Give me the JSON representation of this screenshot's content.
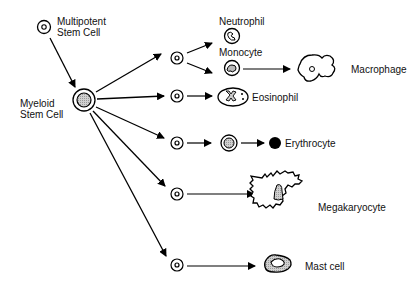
{
  "nodes": {
    "multipotent": {
      "label_line1": "Multipotent",
      "label_line2": "Stem Cell"
    },
    "myeloid": {
      "label_line1": "Myeloid",
      "label_line2": "Stem Cell"
    },
    "neutrophil": {
      "label": "Neutrophil"
    },
    "monocyte": {
      "label": "Monocyte"
    },
    "macrophage": {
      "label": "Macrophage"
    },
    "eosinophil": {
      "label": "Eosinophil"
    },
    "erythrocyte": {
      "label": "Erythrocyte"
    },
    "megakaryocyte": {
      "label": "Megakaryocyte"
    },
    "mast_cell": {
      "label": "Mast cell"
    }
  },
  "edges": [
    [
      "multipotent",
      "myeloid"
    ],
    [
      "myeloid",
      "progenitor-1"
    ],
    [
      "myeloid",
      "progenitor-2"
    ],
    [
      "myeloid",
      "progenitor-3"
    ],
    [
      "myeloid",
      "progenitor-4"
    ],
    [
      "myeloid",
      "progenitor-5"
    ],
    [
      "progenitor-1",
      "neutrophil"
    ],
    [
      "progenitor-1",
      "monocyte"
    ],
    [
      "monocyte",
      "macrophage"
    ],
    [
      "progenitor-2",
      "eosinophil"
    ],
    [
      "progenitor-3",
      "erythroblast"
    ],
    [
      "erythroblast",
      "erythrocyte"
    ],
    [
      "progenitor-4",
      "megakaryocyte"
    ],
    [
      "progenitor-5",
      "mast_cell"
    ]
  ],
  "colors": {
    "stroke": "#000000",
    "fill_gray": "#c8c8c8"
  }
}
